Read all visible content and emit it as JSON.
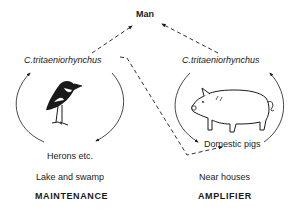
{
  "diagram": {
    "top_node": "Man",
    "left": {
      "vector": "C.tritaeniorhynchus",
      "host": "Herons etc.",
      "habitat": "Lake and swamp",
      "role": "MAINTENANCE",
      "icon": "heron-bird-icon"
    },
    "right": {
      "vector": "C.tritaeniorhynchus",
      "host": "Domestic pigs",
      "habitat": "Near houses",
      "role": "AMPLIFIER",
      "icon": "pig-icon"
    },
    "colors": {
      "ink": "#1a1a1a",
      "background": "#ffffff"
    }
  }
}
